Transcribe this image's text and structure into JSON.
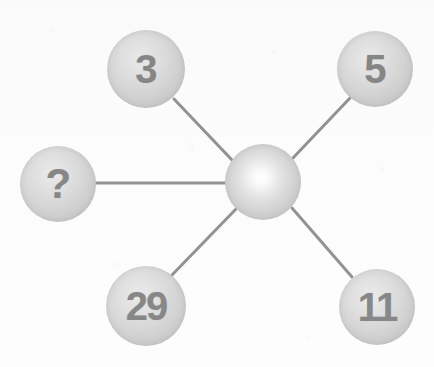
{
  "figure": {
    "type": "node-link-diagram",
    "background_color": "#fcfcfc",
    "edge_color": "#2a2a2a",
    "sphere_rim_color": "#8a8a8a",
    "sphere_core_color": "#d8d8d8",
    "label_color": "#121212",
    "width": 434,
    "height": 367
  },
  "nodes": [
    {
      "id": "center",
      "label": "",
      "role": "hub",
      "cx": 263,
      "cy": 182,
      "r": 38,
      "style": "center",
      "label_class": "node-label is-empty"
    },
    {
      "id": "top-left",
      "label": "3",
      "role": "spoke",
      "cx": 146,
      "cy": 69,
      "r": 39,
      "style": "outer",
      "label_class": "node-label label-single"
    },
    {
      "id": "top-right",
      "label": "5",
      "role": "spoke",
      "cx": 375,
      "cy": 69,
      "r": 38,
      "style": "outer",
      "label_class": "node-label label-single"
    },
    {
      "id": "left",
      "label": "?",
      "role": "spoke-unknown",
      "cx": 58,
      "cy": 184,
      "r": 38,
      "style": "outer",
      "label_class": "node-label label-query"
    },
    {
      "id": "bottom-left",
      "label": "29",
      "role": "spoke",
      "cx": 146,
      "cy": 306,
      "r": 40,
      "style": "outer",
      "label_class": "node-label label-double"
    },
    {
      "id": "bottom-right",
      "label": "11",
      "role": "spoke",
      "cx": 377,
      "cy": 307,
      "r": 38,
      "style": "outer",
      "label_class": "node-label label-double"
    }
  ],
  "edges": [
    {
      "id": "edge-center-top-left",
      "from": "center",
      "to": "top-left",
      "x1": 232,
      "y1": 160,
      "x2": 174,
      "y2": 99,
      "width": 3
    },
    {
      "id": "edge-center-top-right",
      "from": "center",
      "to": "top-right",
      "x1": 292,
      "y1": 159,
      "x2": 350,
      "y2": 98,
      "width": 3
    },
    {
      "id": "edge-center-left",
      "from": "center",
      "to": "left",
      "x1": 225,
      "y1": 183,
      "x2": 95,
      "y2": 183,
      "width": 3
    },
    {
      "id": "edge-center-bottom-left",
      "from": "center",
      "to": "bottom-left",
      "x1": 236,
      "y1": 209,
      "x2": 172,
      "y2": 275,
      "width": 3
    },
    {
      "id": "edge-center-bottom-right",
      "from": "center",
      "to": "bottom-right",
      "x1": 292,
      "y1": 208,
      "x2": 352,
      "y2": 277,
      "width": 3
    }
  ]
}
